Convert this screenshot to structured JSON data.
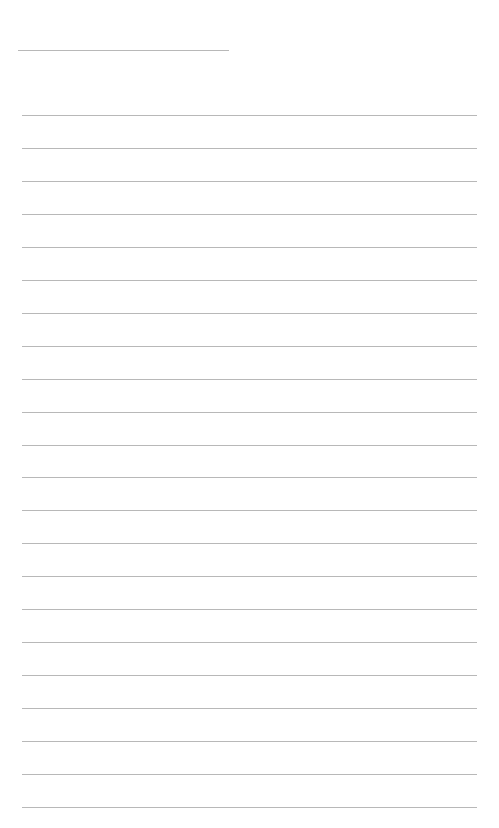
{
  "page": {
    "type": "lined-paper",
    "title_line": {
      "filled_text": ""
    },
    "rule_count": 22,
    "rules": [
      "",
      "",
      "",
      "",
      "",
      "",
      "",
      "",
      "",
      "",
      "",
      "",
      "",
      "",
      "",
      "",
      "",
      "",
      "",
      "",
      "",
      ""
    ],
    "line_color": "#b8b8b8",
    "background": "#ffffff"
  }
}
